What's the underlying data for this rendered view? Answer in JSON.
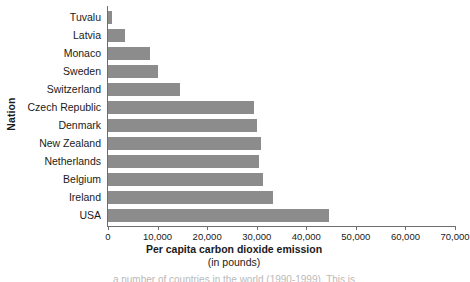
{
  "chart_data": {
    "type": "bar",
    "orientation": "horizontal",
    "title": "",
    "xlabel": "Per capita carbon dioxide emission",
    "xlabel_sub": "(in pounds)",
    "ylabel": "Nation",
    "xlim": [
      0,
      70000
    ],
    "xticks": [
      0,
      10000,
      20000,
      30000,
      40000,
      50000,
      60000,
      70000
    ],
    "xtick_labels": [
      "0",
      "10,000",
      "20,000",
      "30,000",
      "40,000",
      "50,000",
      "60,000",
      "70,000"
    ],
    "grid": false,
    "legend": false,
    "bar_color": "#8c8c8c",
    "axis_color": "#6e6e6e",
    "categories": [
      "Tuvalu",
      "Latvia",
      "Monaco",
      "Sweden",
      "Switzerland",
      "Czech Republic",
      "Denmark",
      "New Zealand",
      "Netherlands",
      "Belgium",
      "Ireland",
      "USA"
    ],
    "values": [
      800,
      3400,
      8500,
      10000,
      14500,
      29500,
      30000,
      30800,
      30500,
      31200,
      33200,
      44500
    ]
  },
  "caption": {
    "clipped_text": "a number of countries in the world (1990-1999). This is"
  }
}
